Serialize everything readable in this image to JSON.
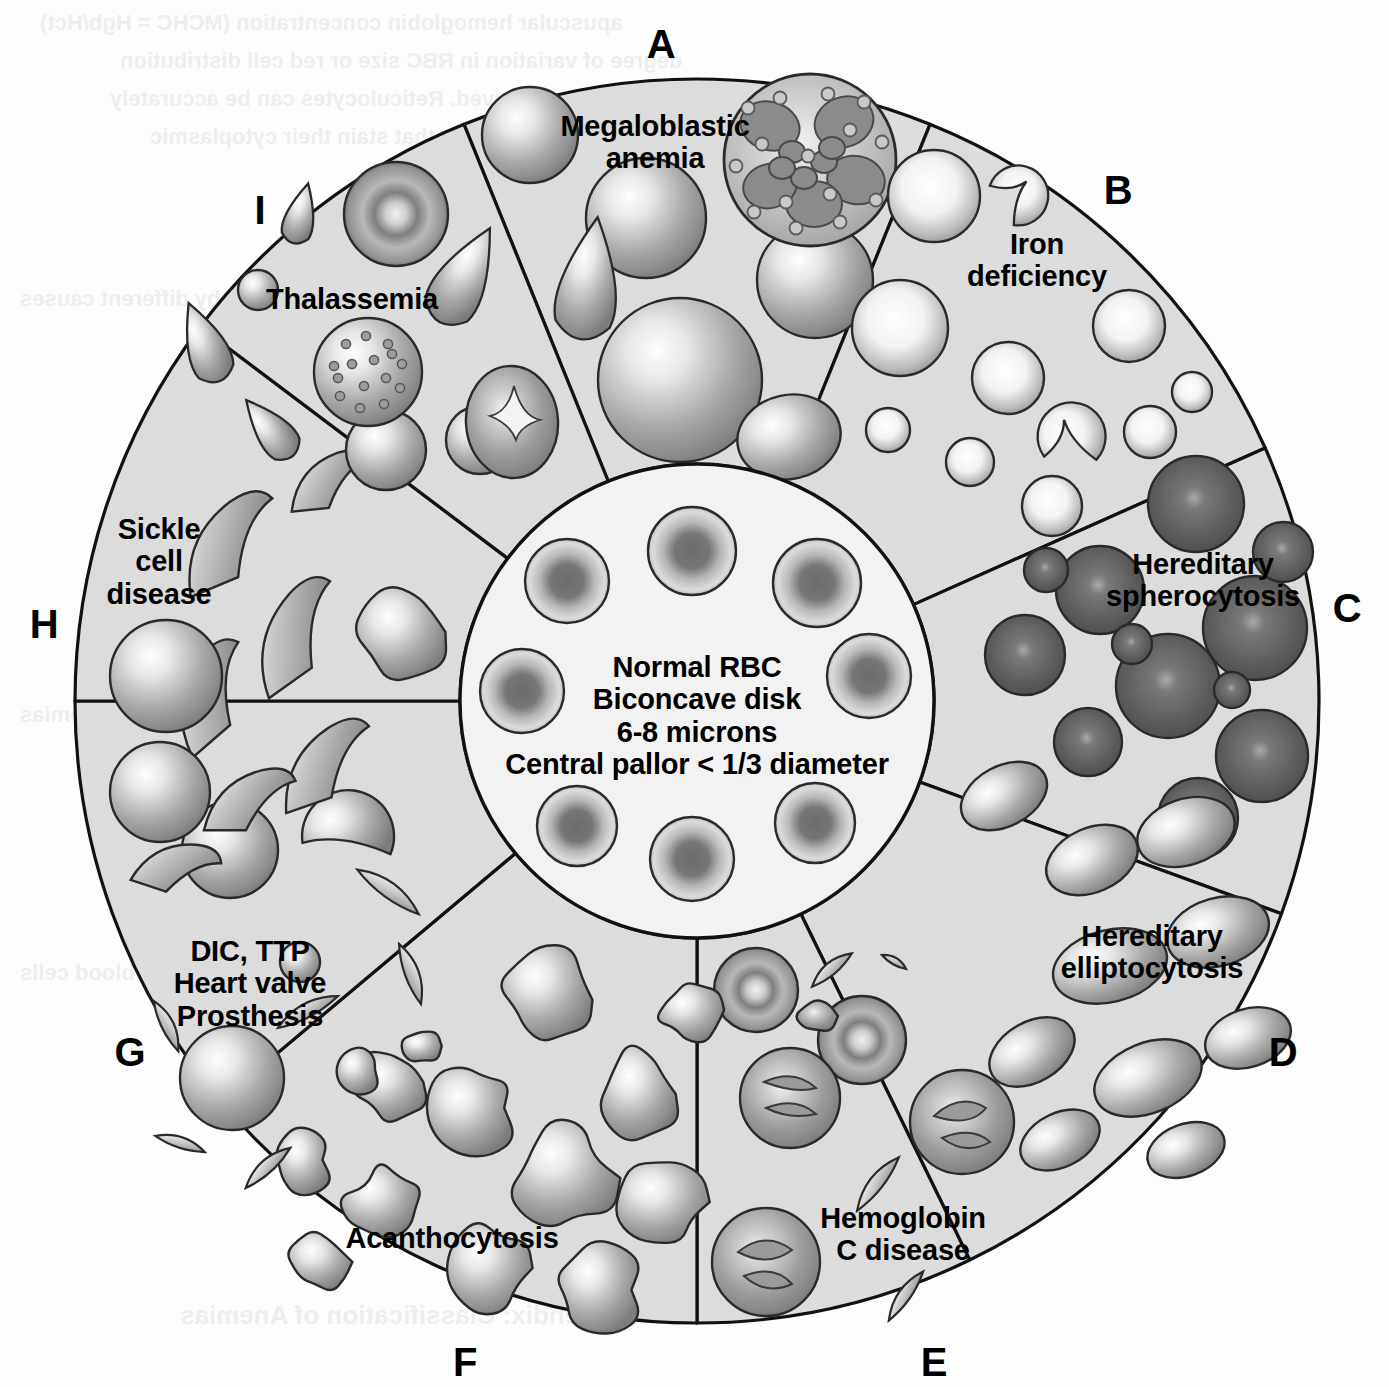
{
  "figure": {
    "type": "radial-wheel-diagram",
    "center": {
      "lines": [
        "Normal RBC",
        "Biconcave disk",
        "6-8 microns",
        "Central pallor < 1/3 diameter"
      ]
    },
    "segments": [
      {
        "letter": "A",
        "label": "Megaloblastic\nanemia",
        "label_lines": [
          "Megaloblastic",
          "anemia"
        ],
        "cells": "macro-ovalocytes with hypersegmented neutrophil",
        "letter_xy": [
          661,
          22
        ],
        "label_xy": [
          655,
          110
        ],
        "a0": -112,
        "a1": -68
      },
      {
        "letter": "B",
        "label": "Iron\ndeficiency",
        "label_lines": [
          "Iron",
          "deficiency"
        ],
        "cells": "microcytic hypochromic cells, pencil cells",
        "letter_xy": [
          1118,
          168
        ],
        "label_xy": [
          1037,
          228
        ],
        "a0": -68,
        "a1": -24
      },
      {
        "letter": "C",
        "label": "Hereditary\nspherocytosis",
        "label_lines": [
          "Hereditary",
          "spherocytosis"
        ],
        "cells": "dense spherocytes without central pallor",
        "letter_xy": [
          1347,
          586
        ],
        "label_xy": [
          1203,
          548
        ],
        "a0": -24,
        "a1": 20
      },
      {
        "letter": "D",
        "label": "Hereditary\nelliptocytosis",
        "label_lines": [
          "Hereditary",
          "elliptocytosis"
        ],
        "cells": "elliptocytes / ovalocytes",
        "letter_xy": [
          1283,
          1030
        ],
        "label_xy": [
          1152,
          920
        ],
        "a0": 20,
        "a1": 64
      },
      {
        "letter": "E",
        "label": "Hemoglobin\nC disease",
        "label_lines": [
          "Hemoglobin",
          "C disease"
        ],
        "cells": "target cells with crystals",
        "letter_xy": [
          934,
          1340
        ],
        "label_xy": [
          903,
          1202
        ],
        "a0": 64,
        "a1": 90
      },
      {
        "letter": "F",
        "label": "Acanthocytosis",
        "label_lines": [
          "Acanthocytosis"
        ],
        "cells": "spiculated acanthocytes (spur cells)",
        "letter_xy": [
          465,
          1340
        ],
        "label_xy": [
          452,
          1222
        ],
        "a0": 90,
        "a1": 140
      },
      {
        "letter": "G",
        "label": "DIC, TTP\nHeart valve\nProsthesis",
        "label_lines": [
          "DIC, TTP",
          "Heart valve",
          "Prosthesis"
        ],
        "cells": "schistocytes / helmet cells",
        "letter_xy": [
          130,
          1030
        ],
        "label_xy": [
          250,
          935
        ],
        "a0": 140,
        "a1": 180
      },
      {
        "letter": "H",
        "label": "Sickle\ncell\ndisease",
        "label_lines": [
          "Sickle",
          "cell",
          "disease"
        ],
        "cells": "sickle cells (drepanocytes)",
        "letter_xy": [
          44,
          602
        ],
        "label_xy": [
          159,
          513
        ],
        "a0": 180,
        "a1": 217
      },
      {
        "letter": "I",
        "label": "Thalassemia",
        "label_lines": [
          "Thalassemia"
        ],
        "cells": "target cells, basophilic stippling, teardrop cells",
        "letter_xy": [
          260,
          188
        ],
        "label_xy": [
          352,
          283
        ],
        "a0": 217,
        "a1": 248
      }
    ],
    "geometry": {
      "cx": 697,
      "cy": 701,
      "r_outer": 622,
      "r_inner": 237
    },
    "colors": {
      "outline": "#111111",
      "segment_fill": "#dcdcdc",
      "core_fill": "#f2f2f2",
      "cell_light": "#ffffff",
      "cell_mid": "#b2b2b2",
      "cell_dark": "#6f6f6f",
      "cell_very_dark": "#4a4a4a",
      "page_background": "#fdfdfd"
    }
  },
  "background_bleed": [
    {
      "text": "apuscular hemoglobin concentration (MCHC = Hgb/Hct)",
      "x": 40,
      "y": 10,
      "size": 22
    },
    {
      "text": "degree of variation in RBC size or red cell distribution",
      "x": 120,
      "y": 48,
      "size": 22
    },
    {
      "text": "width, are also derived. Reticulocytes can be accurately",
      "x": 110,
      "y": 86,
      "size": 22
    },
    {
      "text": "counted with dyes that stain their cytoplasmic",
      "x": 150,
      "y": 124,
      "size": 22
    },
    {
      "text": "Hematology",
      "x": 520,
      "y": 238,
      "size": 44
    },
    {
      "text": "Pathophysiology",
      "x": 470,
      "y": 506,
      "size": 52
    },
    {
      "text": "A. Anemias are classified by different causes",
      "x": 20,
      "y": 286,
      "size": 22
    },
    {
      "text": "hemoglobin is decreased",
      "x": 760,
      "y": 470,
      "size": 22
    },
    {
      "text": "through reduced",
      "x": 780,
      "y": 580,
      "size": 22
    },
    {
      "text": "complete repair",
      "x": 680,
      "y": 630,
      "size": 22
    },
    {
      "text": "Morphologic classification of anemias",
      "x": 20,
      "y": 702,
      "size": 22
    },
    {
      "text": "Destruction of red blood cells",
      "x": 20,
      "y": 960,
      "size": 22
    },
    {
      "text": "3. Hemolytic anemias — increase of de-",
      "x": 430,
      "y": 1000,
      "size": 22
    },
    {
      "text": "Appendix: Classification of Anemias",
      "x": 180,
      "y": 1300,
      "size": 26
    }
  ]
}
